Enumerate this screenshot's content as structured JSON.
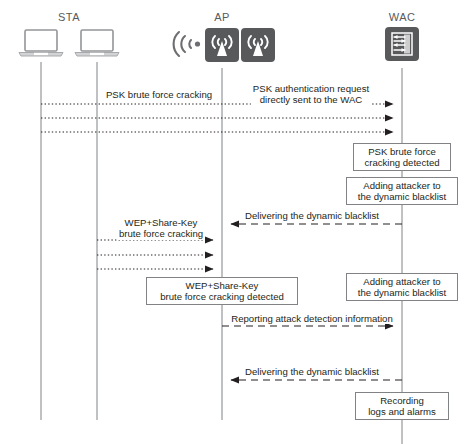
{
  "diagram": {
    "type": "sequence-diagram",
    "colors": {
      "line": "#808285",
      "text": "#231f20",
      "label": "#58595b",
      "icon_dark": "#58595b",
      "background": "#ffffff"
    },
    "participants": [
      {
        "id": "sta1",
        "label": "STA",
        "icon": "laptop-icon",
        "x": 41,
        "label_x": 69,
        "show_label": true
      },
      {
        "id": "sta2",
        "label": "",
        "icon": "laptop-icon",
        "x": 97,
        "label_x": 97,
        "show_label": false
      },
      {
        "id": "ap",
        "label": "AP",
        "icon": "access-point-icon",
        "x": 222,
        "label_x": 222,
        "show_label": true
      },
      {
        "id": "wac",
        "label": "WAC",
        "icon": "wireless-access-controller-icon",
        "x": 402,
        "label_x": 402,
        "show_label": true
      }
    ],
    "messages": [
      {
        "id": "m1",
        "text": "PSK brute force cracking",
        "label_x": 159,
        "label_y": 89,
        "from_x": 41,
        "to_x": 402,
        "y": 104,
        "style": "dotted",
        "direction": "right"
      },
      {
        "id": "m2",
        "text": "PSK authentication request\ndirectly sent to the WAC",
        "label_x": 311,
        "label_y": 83,
        "from_x": 41,
        "to_x": 402,
        "y": 104,
        "style": "dotted",
        "direction": "right",
        "line_hidden": true
      },
      {
        "id": "m3",
        "text": "",
        "from_x": 41,
        "to_x": 402,
        "y": 118,
        "style": "dotted",
        "direction": "right"
      },
      {
        "id": "m4",
        "text": "",
        "from_x": 41,
        "to_x": 402,
        "y": 132,
        "style": "dotted",
        "direction": "right"
      },
      {
        "id": "m5",
        "text": "Delivering the dynamic blacklist",
        "label_x": 312,
        "label_y": 210,
        "from_x": 402,
        "to_x": 222,
        "y": 224,
        "style": "dashed",
        "direction": "left"
      },
      {
        "id": "m6",
        "text": "WEP+Share-Key\nbrute force cracking",
        "label_x": 161,
        "label_y": 217,
        "from_x": 97,
        "to_x": 222,
        "y": 240,
        "style": "dotted",
        "direction": "right"
      },
      {
        "id": "m7",
        "text": "",
        "from_x": 97,
        "to_x": 222,
        "y": 255,
        "style": "dotted",
        "direction": "right"
      },
      {
        "id": "m8",
        "text": "",
        "from_x": 97,
        "to_x": 222,
        "y": 269,
        "style": "dotted",
        "direction": "right"
      },
      {
        "id": "m9",
        "text": "Reporting attack detection information",
        "label_x": 312,
        "label_y": 313,
        "from_x": 222,
        "to_x": 402,
        "y": 326,
        "style": "dashed",
        "direction": "right"
      },
      {
        "id": "m10",
        "text": "Delivering the dynamic blacklist",
        "label_x": 312,
        "label_y": 366,
        "from_x": 402,
        "to_x": 222,
        "y": 380,
        "style": "dashed",
        "direction": "left"
      }
    ],
    "action_boxes": [
      {
        "id": "b1",
        "text": "PSK brute force\ncracking detected",
        "x": 402,
        "y": 143,
        "width": 98,
        "height": 28
      },
      {
        "id": "b2",
        "text": "Adding attacker to\nthe dynamic blacklist",
        "x": 402,
        "y": 177,
        "width": 112,
        "height": 28
      },
      {
        "id": "b3",
        "text": "Adding attacker to\nthe dynamic blacklist",
        "x": 402,
        "y": 273,
        "width": 112,
        "height": 28
      },
      {
        "id": "b4",
        "text": "WEP+Share-Key\nbrute force cracking detected",
        "x": 222,
        "y": 277,
        "width": 152,
        "height": 28
      },
      {
        "id": "b5",
        "text": "Recording\nlogs and alarms",
        "x": 402,
        "y": 392,
        "width": 94,
        "height": 28
      }
    ],
    "lifelines": [
      {
        "id": "ll-sta1",
        "x": 41,
        "top": 62,
        "bottom": 420
      },
      {
        "id": "ll-sta2",
        "x": 97,
        "top": 62,
        "bottom": 420
      },
      {
        "id": "ll-ap",
        "x": 222,
        "top": 68,
        "bottom": 420
      },
      {
        "id": "ll-wac",
        "x": 402,
        "top": 68,
        "bottom": 444
      }
    ]
  }
}
